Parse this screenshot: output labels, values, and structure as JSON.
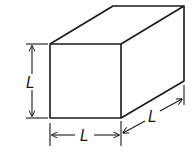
{
  "figure": {
    "labels": {
      "height": "L",
      "width": "L",
      "depth": "L"
    },
    "colors": {
      "stroke": "#1a1a1a",
      "background": "#ffffff"
    }
  }
}
